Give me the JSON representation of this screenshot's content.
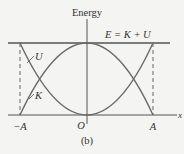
{
  "figure": {
    "axis_title": "Energy",
    "total_label": "E = K + U",
    "curve_u_label": "U",
    "curve_k_label": "K",
    "x_axis_label": "x",
    "ticks": {
      "neg_a": "−A",
      "origin": "O",
      "pos_a": "A"
    },
    "caption": "(b)"
  },
  "colors": {
    "line": "#555555",
    "curve": "#6a6a6a",
    "text": "#333333",
    "background": "#f4f4f2"
  }
}
